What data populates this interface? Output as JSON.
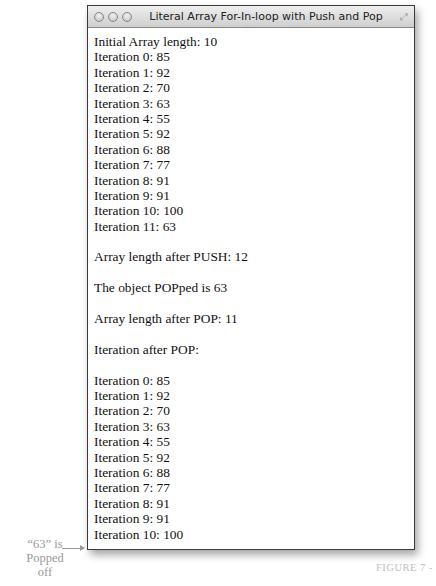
{
  "window": {
    "title": "Literal Array For-In-loop with Push and Pop",
    "buttons": [
      "close",
      "minimize",
      "zoom"
    ]
  },
  "output": {
    "initial_length": "Initial Array length: 10",
    "first_loop": [
      "Iteration 0: 85",
      "Iteration 1: 92",
      "Iteration 2: 70",
      "Iteration 3: 63",
      "Iteration 4: 55",
      "Iteration 5: 92",
      "Iteration 6: 88",
      "Iteration 7: 77",
      "Iteration 8: 91",
      "Iteration 9: 91",
      "Iteration 10: 100",
      "Iteration 11: 63"
    ],
    "after_push": "Array length after PUSH: 12",
    "popped": "The object POPped is 63",
    "after_pop": "Array length after POP: 11",
    "iteration_after_pop": "Iteration after POP:",
    "second_loop": [
      "Iteration 0: 85",
      "Iteration 1: 92",
      "Iteration 2: 70",
      "Iteration 3: 63",
      "Iteration 4: 55",
      "Iteration 5: 92",
      "Iteration 6: 88",
      "Iteration 7: 77",
      "Iteration 8: 91",
      "Iteration 9: 91",
      "Iteration 10: 100"
    ]
  },
  "annotation": {
    "line1": "“63” is",
    "line2": "Popped",
    "line3": "off"
  },
  "caption": "FIGURE 7 -"
}
